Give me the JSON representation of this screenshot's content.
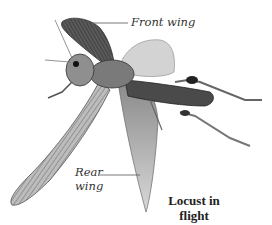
{
  "diagram": {
    "subject": "Locust in flight",
    "labels": {
      "front_wing": "Front wing",
      "rear_wing_line1": "Rear",
      "rear_wing_line2": "wing"
    },
    "caption": {
      "line1": "Locust in",
      "line2": "flight"
    },
    "colors": {
      "background": "#ffffff",
      "leader_line": "#555555",
      "label_text": "#333333"
    }
  }
}
